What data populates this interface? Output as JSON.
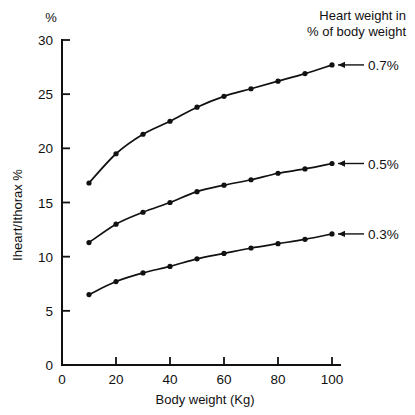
{
  "chart_data": {
    "type": "line",
    "title": "",
    "xlabel": "Body weight (Kg)",
    "ylabel": "Iheart/Ithorax %",
    "y_unit_label": "%",
    "xlim": [
      0,
      100
    ],
    "ylim": [
      0,
      30
    ],
    "x": [
      10,
      20,
      30,
      40,
      50,
      60,
      70,
      80,
      90,
      100
    ],
    "xticks": [
      0,
      20,
      40,
      60,
      80,
      100
    ],
    "yticks": [
      0,
      5,
      10,
      15,
      20,
      25,
      30
    ],
    "grid": false,
    "legend_position": "right",
    "legend_title_line1": "Heart weight in",
    "legend_title_line2": "% of body weight",
    "series": [
      {
        "name": "0.7%",
        "label": "0.7%",
        "values": [
          16.8,
          19.5,
          21.3,
          22.5,
          23.8,
          24.8,
          25.5,
          26.2,
          26.9,
          27.7
        ]
      },
      {
        "name": "0.5%",
        "label": "0.5%",
        "values": [
          11.3,
          13.0,
          14.1,
          15.0,
          16.0,
          16.6,
          17.1,
          17.7,
          18.1,
          18.6
        ]
      },
      {
        "name": "0.3%",
        "label": "0.3%",
        "values": [
          6.5,
          7.7,
          8.5,
          9.1,
          9.8,
          10.3,
          10.8,
          11.2,
          11.6,
          12.1
        ]
      }
    ]
  },
  "colors": {
    "ink": "#111111",
    "background": "#ffffff"
  }
}
